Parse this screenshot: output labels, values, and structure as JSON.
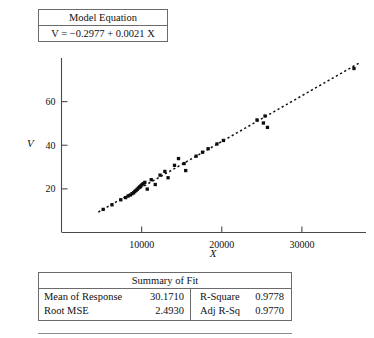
{
  "equation_box": {
    "title": "Model Equation",
    "formula": "V = −0.2977 + 0.0021  X"
  },
  "summary_of_fit": {
    "title": "Summary of Fit",
    "left_rows": [
      {
        "label": "Mean of Response",
        "value": "30.1710"
      },
      {
        "label": "Root MSE",
        "value": "2.4930"
      }
    ],
    "right_rows": [
      {
        "label": "R-Square",
        "value": "0.9778"
      },
      {
        "label": "Adj R-Sq",
        "value": "0.9770"
      }
    ]
  },
  "chart_data": {
    "type": "scatter",
    "title": "",
    "xlabel": "X",
    "ylabel": "V",
    "xlim": [
      0,
      38000
    ],
    "ylim": [
      0,
      80
    ],
    "xticks": [
      10000,
      20000,
      30000
    ],
    "yticks": [
      20,
      40,
      60
    ],
    "xtick_labels": [
      "10000",
      "20000",
      "30000"
    ],
    "ytick_labels": [
      "20",
      "40",
      "60"
    ],
    "grid": false,
    "legend": "none",
    "fit_line": {
      "style": "dotted",
      "intercept": -0.2977,
      "slope": 0.0021,
      "x_start": 4600,
      "x_end": 37200
    },
    "points": [
      {
        "x": 5200,
        "y": 10.6
      },
      {
        "x": 6300,
        "y": 12.7
      },
      {
        "x": 7400,
        "y": 15.0
      },
      {
        "x": 8000,
        "y": 16.0
      },
      {
        "x": 8300,
        "y": 16.7
      },
      {
        "x": 8600,
        "y": 17.2
      },
      {
        "x": 8800,
        "y": 17.8
      },
      {
        "x": 9000,
        "y": 18.2
      },
      {
        "x": 9150,
        "y": 18.8
      },
      {
        "x": 9300,
        "y": 19.3
      },
      {
        "x": 9450,
        "y": 19.8
      },
      {
        "x": 9600,
        "y": 20.4
      },
      {
        "x": 9750,
        "y": 20.9
      },
      {
        "x": 9900,
        "y": 21.4
      },
      {
        "x": 10050,
        "y": 21.9
      },
      {
        "x": 10200,
        "y": 22.4
      },
      {
        "x": 10400,
        "y": 23.0
      },
      {
        "x": 10700,
        "y": 19.9
      },
      {
        "x": 11200,
        "y": 24.2
      },
      {
        "x": 11700,
        "y": 22.0
      },
      {
        "x": 12300,
        "y": 26.3
      },
      {
        "x": 12900,
        "y": 28.0
      },
      {
        "x": 13300,
        "y": 25.1
      },
      {
        "x": 14100,
        "y": 30.8
      },
      {
        "x": 14600,
        "y": 33.9
      },
      {
        "x": 15300,
        "y": 31.6
      },
      {
        "x": 15500,
        "y": 28.4
      },
      {
        "x": 16800,
        "y": 35.0
      },
      {
        "x": 17600,
        "y": 36.8
      },
      {
        "x": 18300,
        "y": 38.4
      },
      {
        "x": 19400,
        "y": 40.6
      },
      {
        "x": 20200,
        "y": 42.2
      },
      {
        "x": 24400,
        "y": 51.6
      },
      {
        "x": 25200,
        "y": 50.2
      },
      {
        "x": 25400,
        "y": 53.4
      },
      {
        "x": 25700,
        "y": 48.2
      },
      {
        "x": 36500,
        "y": 75.2
      }
    ]
  }
}
